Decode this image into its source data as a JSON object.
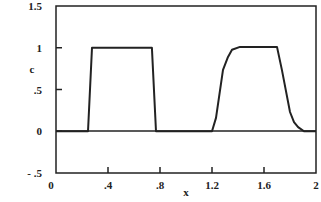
{
  "chart_data": {
    "type": "line",
    "title": "",
    "xlabel": "x",
    "ylabel": "c",
    "xlim": [
      0,
      2
    ],
    "ylim": [
      -0.5,
      1.5
    ],
    "grid": false,
    "legend": null,
    "xticks": [
      "0",
      ".4",
      ".8",
      "1.2",
      "1.6",
      "2"
    ],
    "yticks": [
      "1.5",
      "1",
      ".5",
      "0",
      "- .5"
    ],
    "series": [
      {
        "name": "c",
        "x": [
          0,
          0.246,
          0.277,
          0.738,
          0.769,
          1.2,
          1.231,
          1.285,
          1.323,
          1.354,
          1.415,
          1.7,
          1.738,
          1.8,
          1.831,
          1.862,
          1.908,
          2.0
        ],
        "y": [
          0,
          0,
          1.0,
          1.0,
          0,
          0,
          0.16,
          0.735,
          0.89,
          0.975,
          1.01,
          1.01,
          0.735,
          0.23,
          0.11,
          0.05,
          0,
          0
        ]
      }
    ]
  }
}
